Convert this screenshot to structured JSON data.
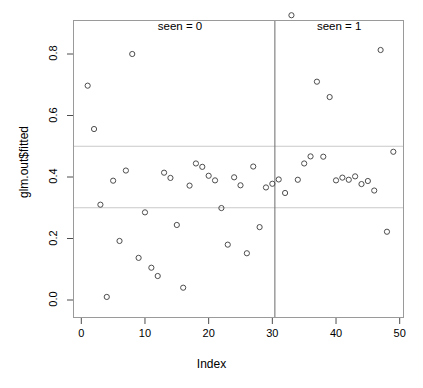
{
  "chart_data": {
    "type": "scatter",
    "title": "",
    "xlabel": "Index",
    "ylabel": "glm.out$fitted",
    "xlim": [
      0.5,
      50.5
    ],
    "ylim": [
      0.0,
      0.95
    ],
    "xticks": [
      0,
      10,
      20,
      30,
      40,
      50
    ],
    "yticks": [
      0.0,
      0.2,
      0.4,
      0.6,
      0.8
    ],
    "xtick_labels": [
      "0",
      "10",
      "20",
      "30",
      "40",
      "50"
    ],
    "ytick_labels": [
      "0.0",
      "0.2",
      "0.4",
      "0.6",
      "0.8"
    ],
    "grid": false,
    "legend": "none",
    "point_symbol": "open-circle",
    "point_color": "#4d4d4d",
    "reference_lines": {
      "horizontal": [
        {
          "y": 0.5,
          "color": "#c9c9c9"
        },
        {
          "y": 0.3,
          "color": "#c9c9c9"
        }
      ],
      "vertical": [
        {
          "x": 30.4,
          "color": "#6b6b6b"
        }
      ]
    },
    "annotations": [
      {
        "text": "seen = 0",
        "x": 15.5,
        "y": 0.885
      },
      {
        "text": "seen = 1",
        "x": 40.5,
        "y": 0.885
      }
    ],
    "x": [
      1,
      2,
      3,
      4,
      5,
      6,
      7,
      8,
      9,
      10,
      11,
      12,
      13,
      14,
      15,
      16,
      17,
      18,
      19,
      20,
      21,
      22,
      23,
      24,
      25,
      26,
      27,
      28,
      29,
      30,
      31,
      32,
      33,
      34,
      35,
      36,
      37,
      38,
      39,
      40,
      41,
      42,
      43,
      44,
      45,
      46,
      47,
      48,
      49
    ],
    "y": [
      0.697,
      0.556,
      0.31,
      0.01,
      0.388,
      0.192,
      0.421,
      0.8,
      0.137,
      0.285,
      0.105,
      0.078,
      0.414,
      0.397,
      0.244,
      0.04,
      0.372,
      0.444,
      0.433,
      0.404,
      0.389,
      0.299,
      0.18,
      0.399,
      0.373,
      0.152,
      0.434,
      0.237,
      0.366,
      0.378,
      0.392,
      0.348,
      0.926,
      0.391,
      0.444,
      0.467,
      0.71,
      0.466,
      0.66,
      0.389,
      0.398,
      0.391,
      0.402,
      0.377,
      0.387,
      0.356,
      0.813,
      0.222,
      0.482
    ]
  },
  "axes": {
    "x_title": "Index",
    "y_title": "glm.out$fitted"
  }
}
